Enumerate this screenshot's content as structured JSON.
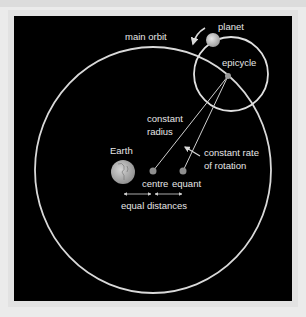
{
  "diagram": {
    "colors": {
      "page_background": "#ebebeb",
      "panel_background": "#000000",
      "line": "#d9d9d9",
      "text": "#e6e6e6",
      "dot": "#9a9a9a",
      "earth": "#b8b8b8"
    },
    "labels": {
      "planet": "planet",
      "main_orbit": "main orbit",
      "epicycle": "epicycle",
      "constant_radius_line1": "constant",
      "constant_radius_line2": "radius",
      "constant_rate_line1": "constant rate",
      "constant_rate_line2": "of rotation",
      "earth": "Earth",
      "centre": "centre",
      "equant": "equant",
      "equal_distances": "equal distances"
    },
    "elements": [
      {
        "name": "main orbit",
        "shape": "circle",
        "cx": 153,
        "cy": 170,
        "rx": 118,
        "ry": 123
      },
      {
        "name": "epicycle",
        "shape": "circle",
        "cx": 231,
        "cy": 74,
        "r": 37
      },
      {
        "name": "planet",
        "shape": "dot",
        "cx": 213,
        "cy": 40,
        "r": 7
      },
      {
        "name": "epicycle centre",
        "shape": "dot",
        "cx": 228,
        "cy": 76,
        "r": 3
      },
      {
        "name": "Earth",
        "shape": "dot",
        "cx": 123,
        "cy": 172,
        "r": 12
      },
      {
        "name": "centre",
        "shape": "dot",
        "cx": 153,
        "cy": 171,
        "r": 3.5
      },
      {
        "name": "equant",
        "shape": "dot",
        "cx": 183,
        "cy": 171,
        "r": 3.5
      }
    ]
  }
}
